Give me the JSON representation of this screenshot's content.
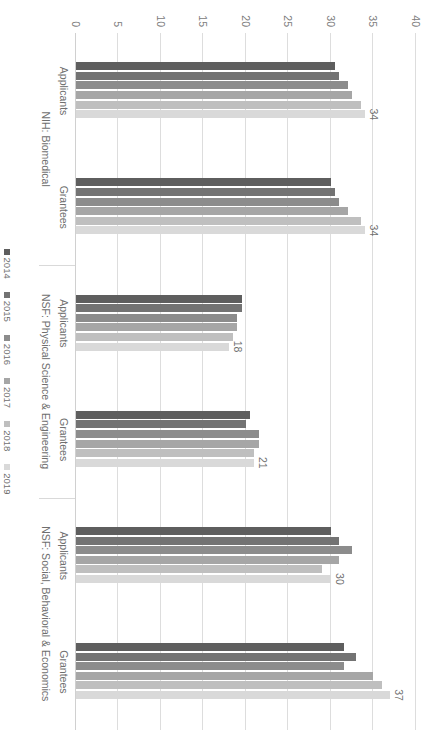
{
  "chart_data": {
    "type": "bar",
    "orientation": "horizontal",
    "title": "",
    "subtitle": "",
    "xlabel": "",
    "ylabel": "",
    "ylim": [
      0,
      40
    ],
    "tick_values": [
      0,
      5,
      10,
      15,
      20,
      25,
      30,
      35,
      40
    ],
    "tick_labels": [
      "0",
      "5",
      "10",
      "15",
      "20",
      "25",
      "30",
      "35",
      "40"
    ],
    "grid": true,
    "legend_position": "bottom",
    "legend": [
      "2014",
      "2015",
      "2016",
      "2017",
      "2018",
      "2019"
    ],
    "series_colors": [
      "#5e5e5e",
      "#737373",
      "#8c8c8c",
      "#a6a6a6",
      "#bfbfbf",
      "#d9d9d9"
    ],
    "categories": [
      "Applicants",
      "Grantees",
      "Applicants",
      "Grantees",
      "Applicants",
      "Grantees"
    ],
    "super_categories": [
      {
        "label": "NIH: Biomedical",
        "span": 2
      },
      {
        "label": "NSF: Physical Science & Engineering",
        "span": 2
      },
      {
        "label": "NSF: Social, Behavioral & Economics",
        "span": 2
      }
    ],
    "series": [
      {
        "name": "2014",
        "values": [
          30.5,
          30.0,
          19.5,
          20.5,
          30.0,
          31.5
        ]
      },
      {
        "name": "2015",
        "values": [
          31.0,
          30.5,
          19.5,
          20.0,
          31.0,
          33.0
        ]
      },
      {
        "name": "2016",
        "values": [
          32.0,
          31.0,
          19.0,
          21.5,
          32.5,
          31.5
        ]
      },
      {
        "name": "2017",
        "values": [
          32.5,
          32.0,
          19.0,
          21.5,
          31.0,
          35.0
        ]
      },
      {
        "name": "2018",
        "values": [
          33.5,
          33.5,
          18.5,
          21.0,
          29.0,
          36.0
        ]
      },
      {
        "name": "2019",
        "values": [
          34.0,
          34.0,
          18.0,
          21.0,
          30.0,
          37.0
        ]
      }
    ],
    "data_labels": [
      {
        "group": "NIH: Biomedical — Applicants",
        "series": "2019",
        "value": "34"
      },
      {
        "group": "NIH: Biomedical — Grantees",
        "series": "2019",
        "value": "34"
      },
      {
        "group": "NSF: Physical Science & Engineering — Applicants",
        "series": "2019",
        "value": "18"
      },
      {
        "group": "NSF: Physical Science & Engineering — Grantees",
        "series": "2019",
        "value": "21"
      },
      {
        "group": "NSF: Social, Behavioral & Economics — Applicants",
        "series": "2019",
        "value": "30"
      },
      {
        "group": "NSF: Social, Behavioral & Economics — Grantees",
        "series": "2019",
        "value": "37"
      }
    ]
  }
}
